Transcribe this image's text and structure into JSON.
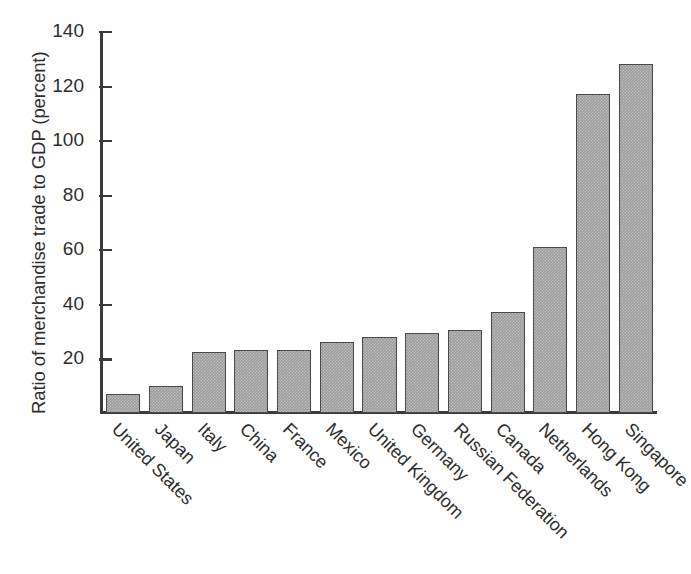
{
  "chart_data": {
    "type": "bar",
    "title": "",
    "xlabel": "",
    "ylabel": "Ratio of merchandise trade to GDP (percent)",
    "ylim": [
      0,
      140
    ],
    "yticks": [
      0,
      20,
      40,
      60,
      80,
      100,
      120,
      140
    ],
    "ytick_labels": [
      "",
      "20",
      "40",
      "60",
      "80",
      "100",
      "120",
      "140"
    ],
    "grid": false,
    "legend": null,
    "orientation": "vertical",
    "bar_color": "#9c9c9c",
    "bar_edge_color": "#4a4a4a",
    "background_color": "#ffffff",
    "categories": [
      "United States",
      "Japan",
      "Italy",
      "China",
      "France",
      "Mexico",
      "United Kingdom",
      "Germany",
      "Russian Federation",
      "Canada",
      "Netherlands",
      "Hong Kong",
      "Singapore"
    ],
    "values": [
      7,
      10,
      22.5,
      23,
      23,
      26,
      28,
      29.5,
      30.5,
      37,
      61,
      117,
      128
    ]
  }
}
